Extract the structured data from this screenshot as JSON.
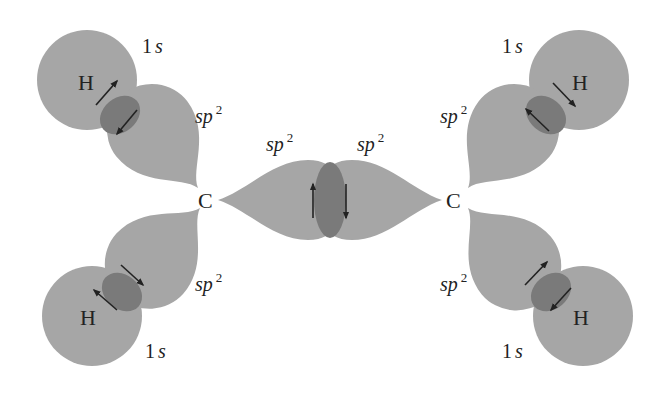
{
  "diagram": {
    "type": "orbital-overlap",
    "colors": {
      "orbital_fill": "#a6a6a6",
      "overlap_fill": "#7a7a7a",
      "arrow": "#222222",
      "text": "#222222",
      "background": "#ffffff"
    },
    "atoms": {
      "c_left": "C",
      "c_right": "C",
      "h_top_left": "H",
      "h_bottom_left": "H",
      "h_top_right": "H",
      "h_bottom_right": "H"
    },
    "orbital_labels": {
      "s_prefix": "1",
      "s_letter": "s",
      "sp_letters": "sp",
      "sp_sup": "2"
    },
    "bonds": [
      {
        "name": "C-H top-left",
        "orbitals": [
          "sp2",
          "1s"
        ],
        "electrons": "paired, opposite spin"
      },
      {
        "name": "C-H bottom-left",
        "orbitals": [
          "sp2",
          "1s"
        ],
        "electrons": "paired, opposite spin"
      },
      {
        "name": "C-C",
        "orbitals": [
          "sp2",
          "sp2"
        ],
        "electrons": "paired, opposite spin"
      },
      {
        "name": "C-H top-right",
        "orbitals": [
          "sp2",
          "1s"
        ],
        "electrons": "paired, opposite spin"
      },
      {
        "name": "C-H bottom-right",
        "orbitals": [
          "sp2",
          "1s"
        ],
        "electrons": "paired, opposite spin"
      }
    ]
  }
}
